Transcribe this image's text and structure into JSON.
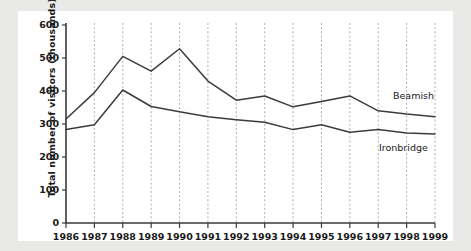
{
  "figure": {
    "background_color": "#e9e9e7",
    "plot_background_color": "#ffffff",
    "line_color": "#3c3c3c",
    "grid_color": "#9b9b9b",
    "axis_color": "#3a3a3a"
  },
  "chart_data": {
    "type": "line",
    "title": "",
    "xlabel": "",
    "ylabel": "Total number of visitors (thousands)",
    "categories": [
      "1986",
      "1987",
      "1988",
      "1989",
      "1990",
      "1991",
      "1992",
      "1993",
      "1994",
      "1995",
      "1996",
      "1997",
      "1998",
      "1999"
    ],
    "ylim": [
      0,
      600
    ],
    "yticks": [
      "0",
      "100",
      "200",
      "300",
      "400",
      "500",
      "600"
    ],
    "ytick_values": [
      0,
      100,
      200,
      300,
      400,
      500,
      600
    ],
    "grid": "vertical-dashed",
    "legend_position": "inline-right",
    "series": [
      {
        "name": "Beamish",
        "label": "Beamish",
        "values": [
          315,
          395,
          505,
          460,
          528,
          430,
          372,
          385,
          352,
          368,
          385,
          340,
          330,
          322
        ]
      },
      {
        "name": "Ironbridge",
        "label": "Ironbridge",
        "values": [
          283,
          298,
          403,
          353,
          337,
          322,
          313,
          305,
          283,
          298,
          275,
          283,
          273,
          270
        ]
      }
    ]
  }
}
